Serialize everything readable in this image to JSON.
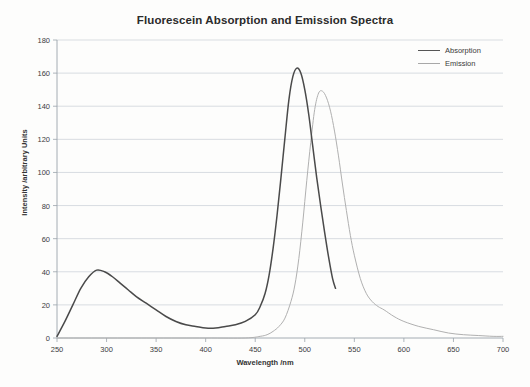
{
  "chart_data": {
    "type": "line",
    "title": "Fluorescein Absorption and Emission Spectra",
    "xlabel": "Wavelength /nm",
    "ylabel": "Intensity /arbitrary Units",
    "xlim": [
      250,
      700
    ],
    "ylim": [
      0,
      180
    ],
    "xticks": [
      250,
      300,
      350,
      400,
      450,
      500,
      550,
      600,
      650,
      700
    ],
    "yticks": [
      0,
      20,
      40,
      60,
      80,
      100,
      120,
      140,
      160,
      180
    ],
    "grid": "horizontal",
    "legend_position": "top-right",
    "series": [
      {
        "name": "Absorption",
        "color": "#4a4a4a",
        "peak_x": 492,
        "peak_y": 163,
        "secondary_peak_x": 290,
        "secondary_peak_y": 41,
        "x": [
          250,
          258,
          266,
          274,
          282,
          290,
          298,
          306,
          314,
          322,
          330,
          340,
          350,
          360,
          370,
          380,
          390,
          400,
          410,
          420,
          430,
          440,
          450,
          455,
          460,
          464,
          468,
          472,
          476,
          480,
          484,
          488,
          492,
          496,
          500,
          504,
          508,
          512,
          516,
          520,
          524,
          528,
          531
        ],
        "y": [
          1,
          10,
          20,
          30,
          37,
          41,
          40,
          37,
          33,
          29,
          25,
          21,
          17,
          13,
          10,
          8,
          7,
          6,
          6,
          7,
          8,
          10,
          14,
          19,
          27,
          38,
          54,
          74,
          97,
          121,
          144,
          158,
          163,
          160,
          150,
          135,
          116,
          97,
          80,
          64,
          49,
          36,
          30
        ]
      },
      {
        "name": "Emission",
        "color": "#b0b0b0",
        "peak_x": 515,
        "peak_y": 149,
        "x": [
          250,
          340,
          400,
          440,
          455,
          462,
          468,
          474,
          480,
          486,
          490,
          494,
          498,
          502,
          506,
          510,
          514,
          518,
          522,
          526,
          530,
          534,
          538,
          542,
          546,
          550,
          556,
          562,
          568,
          574,
          580,
          590,
          600,
          615,
          630,
          645,
          660,
          675,
          690,
          700
        ],
        "y": [
          0,
          0,
          0,
          0,
          1,
          2,
          4,
          7,
          12,
          22,
          32,
          48,
          70,
          95,
          118,
          138,
          148,
          149,
          145,
          137,
          125,
          110,
          93,
          77,
          62,
          50,
          36,
          27,
          22,
          19,
          17,
          13,
          10,
          7,
          5,
          3,
          2,
          1.5,
          1,
          1
        ]
      }
    ]
  },
  "legend": {
    "items": [
      {
        "label": "Absorption"
      },
      {
        "label": "Emission"
      }
    ]
  },
  "colors": {
    "absorption": "#4a4a4a",
    "emission": "#b0b0b0",
    "grid": "#c9cfd6",
    "axis": "#9aa3ab",
    "text": "#3c3c3c"
  }
}
